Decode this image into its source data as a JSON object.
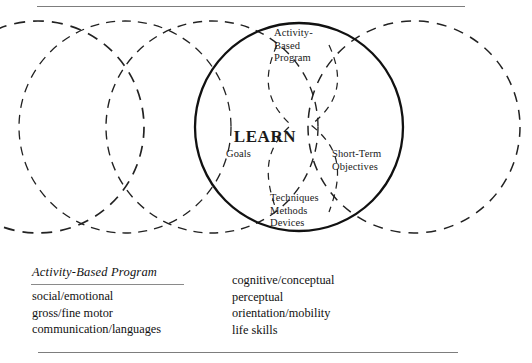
{
  "diagram": {
    "title_center": "LEARN",
    "labels": {
      "activity_based_program": "Activity-\nBased\nProgram",
      "goals": "Goals",
      "short_term_objectives": "Short-Term\nObjectives",
      "techniques_methods_devices": "Techniques\nMethods\nDevices"
    },
    "circles": {
      "solid_stroke_color": "#111111",
      "dashed_stroke_color": "#222222",
      "count_total": 4,
      "count_dashed": 3,
      "count_solid": 1
    }
  },
  "legend": {
    "heading": "Activity-Based Program",
    "left_column": [
      "social/emotional",
      "gross/fine motor",
      "communication/languages"
    ],
    "right_column": [
      "cognitive/conceptual",
      "perceptual",
      "orientation/mobility",
      "life skills"
    ]
  },
  "rules": {
    "top": "",
    "bottom": ""
  }
}
